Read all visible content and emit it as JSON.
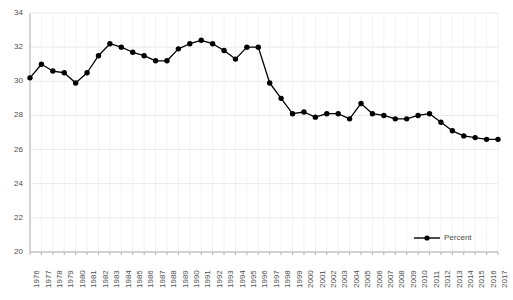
{
  "chart_data": {
    "type": "line",
    "title": "",
    "subtitle": "",
    "xlabel": "",
    "ylabel": "",
    "xlim": [
      1976,
      2017
    ],
    "ylim": [
      20,
      34
    ],
    "ytick_step": 2,
    "grid": true,
    "grid_axis": "y",
    "legend_position": "bottom-right",
    "series": [
      {
        "name": "Percent",
        "color": "#000000",
        "marker": "circle",
        "x": [
          1976,
          1977,
          1978,
          1979,
          1980,
          1981,
          1982,
          1983,
          1984,
          1985,
          1986,
          1987,
          1988,
          1989,
          1990,
          1991,
          1992,
          1993,
          1994,
          1995,
          1996,
          1997,
          1998,
          1999,
          2000,
          2001,
          2002,
          2003,
          2004,
          2005,
          2006,
          2007,
          2008,
          2009,
          2010,
          2011,
          2012,
          2013,
          2014,
          2015,
          2016,
          2017
        ],
        "values": [
          30.2,
          31.0,
          30.6,
          30.5,
          29.9,
          30.5,
          31.5,
          32.2,
          32.0,
          31.7,
          31.5,
          31.2,
          31.2,
          31.9,
          32.2,
          32.4,
          32.2,
          31.8,
          31.3,
          32.0,
          32.0,
          29.9,
          29.0,
          28.1,
          28.2,
          27.9,
          28.1,
          28.1,
          27.8,
          28.7,
          28.1,
          28.0,
          27.8,
          27.8,
          28.0,
          28.1,
          27.6,
          27.1,
          26.8,
          26.7,
          26.6,
          26.6
        ]
      }
    ],
    "ytick_labels": [
      "34",
      "32",
      "30",
      "28",
      "26",
      "24",
      "22",
      "20"
    ],
    "ytick_values": [
      34,
      32,
      30,
      28,
      26,
      24,
      22,
      20
    ],
    "xtick_labels": [
      "1976",
      "1977",
      "1978",
      "1979",
      "1980",
      "1981",
      "1982",
      "1983",
      "1984",
      "1985",
      "1986",
      "1987",
      "1988",
      "1989",
      "1990",
      "1991",
      "1992",
      "1993",
      "1994",
      "1995",
      "1996",
      "1997",
      "1998",
      "1999",
      "2000",
      "2001",
      "2002",
      "2003",
      "2004",
      "2005",
      "2006",
      "2007",
      "2008",
      "2009",
      "2010",
      "2011",
      "2012",
      "2013",
      "2014",
      "2015",
      "2016",
      "2017"
    ]
  },
  "legend": {
    "entries": [
      {
        "label": "Percent"
      }
    ]
  },
  "colors": {
    "line": "#000000",
    "marker": "#000000",
    "grid": "#e8e8e8",
    "axis": "#b0b0b0",
    "tick_text": "#4d4d4d",
    "background": "#ffffff"
  }
}
